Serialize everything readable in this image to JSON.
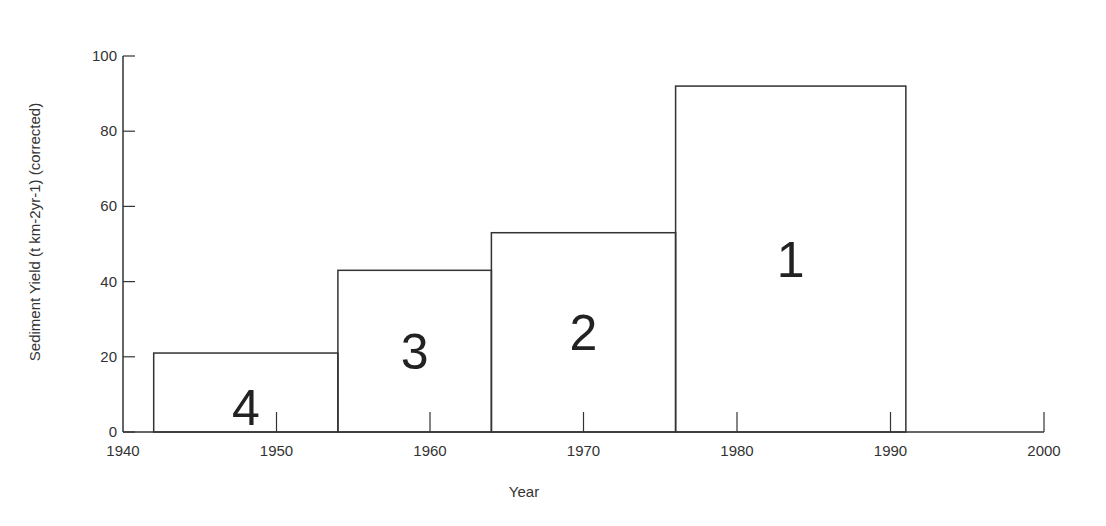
{
  "chart_data": {
    "type": "bar",
    "subtype": "histogram-step",
    "title": "",
    "xlabel": "Year",
    "ylabel": "Sediment Yield (t km-2yr-1) (corrected)",
    "xlim": [
      1940,
      2000
    ],
    "ylim": [
      0,
      100
    ],
    "x_ticks": [
      1940,
      1950,
      1960,
      1970,
      1980,
      1990,
      2000
    ],
    "y_ticks": [
      0,
      20,
      40,
      60,
      80,
      100
    ],
    "grid": false,
    "legend": null,
    "bars": [
      {
        "label": "4",
        "x_start": 1942,
        "x_end": 1954,
        "value": 21
      },
      {
        "label": "3",
        "x_start": 1954,
        "x_end": 1964,
        "value": 43
      },
      {
        "label": "2",
        "x_start": 1964,
        "x_end": 1976,
        "value": 53
      },
      {
        "label": "1",
        "x_start": 1976,
        "x_end": 1991,
        "value": 92
      }
    ],
    "categories": [
      "1942-1954",
      "1954-1964",
      "1964-1976",
      "1976-1991"
    ],
    "values": [
      21,
      43,
      53,
      92
    ]
  },
  "colors": {
    "line": "#333333",
    "background": "#ffffff"
  }
}
